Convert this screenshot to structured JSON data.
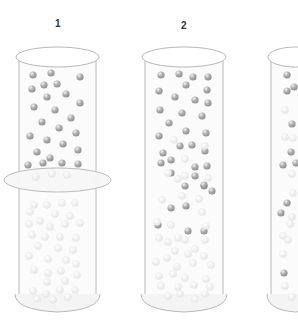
{
  "diagram": {
    "labels": [
      {
        "text": "1",
        "x": 55,
        "y": 18
      },
      {
        "text": "2",
        "x": 181,
        "y": 20
      }
    ],
    "colors": {
      "outline": "#b8b8b8",
      "glass_fill": "#fbfbfb",
      "ball_dark": "#8c8c8c",
      "ball_light": "#e4e4e4",
      "background": "#ffffff"
    },
    "cylinders": [
      {
        "id": 1,
        "left": 19,
        "right": 96,
        "top": 57,
        "bottom": 300,
        "has_divider_ring": true,
        "ring_y": 180,
        "dark_balls": [
          [
            33,
            75
          ],
          [
            51,
            73
          ],
          [
            80,
            77
          ],
          [
            32,
            89
          ],
          [
            44,
            85
          ],
          [
            57,
            84
          ],
          [
            66,
            94
          ],
          [
            47,
            97
          ],
          [
            80,
            103
          ],
          [
            34,
            107
          ],
          [
            55,
            110
          ],
          [
            71,
            118
          ],
          [
            42,
            122
          ],
          [
            59,
            128
          ],
          [
            76,
            133
          ],
          [
            30,
            136
          ],
          [
            47,
            140
          ],
          [
            63,
            144
          ],
          [
            78,
            150
          ],
          [
            37,
            152
          ],
          [
            50,
            158
          ],
          [
            62,
            163
          ],
          [
            28,
            165
          ],
          [
            43,
            163
          ],
          [
            78,
            164
          ]
        ],
        "light_balls": [
          [
            36,
            177
          ],
          [
            52,
            174
          ],
          [
            67,
            175
          ],
          [
            34,
            205
          ],
          [
            47,
            205
          ],
          [
            62,
            203
          ],
          [
            75,
            203
          ],
          [
            30,
            212
          ],
          [
            55,
            214
          ],
          [
            70,
            216
          ],
          [
            29,
            224
          ],
          [
            40,
            221
          ],
          [
            50,
            227
          ],
          [
            65,
            224
          ],
          [
            80,
            223
          ],
          [
            32,
            235
          ],
          [
            45,
            237
          ],
          [
            60,
            237
          ],
          [
            76,
            238
          ],
          [
            38,
            246
          ],
          [
            58,
            248
          ],
          [
            73,
            250
          ],
          [
            29,
            256
          ],
          [
            48,
            259
          ],
          [
            66,
            260
          ],
          [
            76,
            264
          ],
          [
            34,
            270
          ],
          [
            48,
            273
          ],
          [
            61,
            271
          ],
          [
            77,
            275
          ],
          [
            47,
            282
          ],
          [
            65,
            281
          ],
          [
            33,
            291
          ],
          [
            46,
            294
          ],
          [
            60,
            290
          ],
          [
            75,
            290
          ],
          [
            37,
            299
          ],
          [
            53,
            300
          ],
          [
            68,
            297
          ]
        ]
      },
      {
        "id": 2,
        "left": 145,
        "right": 223,
        "top": 57,
        "bottom": 300,
        "has_divider_ring": false,
        "dark_balls": [
          [
            161,
            75
          ],
          [
            179,
            74
          ],
          [
            193,
            77
          ],
          [
            208,
            77
          ],
          [
            186,
            85
          ],
          [
            159,
            91
          ],
          [
            207,
            90
          ],
          [
            175,
            97
          ],
          [
            195,
            100
          ],
          [
            208,
            103
          ],
          [
            160,
            110
          ],
          [
            182,
            113
          ],
          [
            202,
            116
          ],
          [
            169,
            123
          ],
          [
            186,
            131
          ],
          [
            159,
            136
          ],
          [
            206,
            133
          ],
          [
            180,
            146
          ],
          [
            163,
            153
          ],
          [
            192,
            145
          ],
          [
            205,
            151
          ],
          [
            161,
            163
          ],
          [
            171,
            160
          ],
          [
            207,
            166
          ],
          [
            195,
            176
          ],
          [
            171,
            173
          ],
          [
            195,
            167
          ],
          [
            171,
            208
          ],
          [
            212,
            191
          ],
          [
            158,
            225
          ],
          [
            186,
            206
          ],
          [
            188,
            231
          ],
          [
            204,
            231
          ],
          [
            204,
            186
          ],
          [
            185,
            186
          ],
          [
            204,
            185
          ]
        ],
        "light_balls": [
          [
            174,
            140
          ],
          [
            205,
            146
          ],
          [
            185,
            159
          ],
          [
            168,
            173
          ],
          [
            185,
            176
          ],
          [
            178,
            179
          ],
          [
            208,
            178
          ],
          [
            182,
            196
          ],
          [
            199,
            199
          ],
          [
            162,
            200
          ],
          [
            202,
            212
          ],
          [
            157,
            222
          ],
          [
            171,
            225
          ],
          [
            206,
            226
          ],
          [
            168,
            242
          ],
          [
            185,
            240
          ],
          [
            178,
            238
          ],
          [
            205,
            240
          ],
          [
            159,
            238
          ],
          [
            175,
            251
          ],
          [
            195,
            249
          ],
          [
            167,
            258
          ],
          [
            204,
            256
          ],
          [
            188,
            254
          ],
          [
            156,
            262
          ],
          [
            177,
            267
          ],
          [
            193,
            263
          ],
          [
            211,
            265
          ],
          [
            159,
            276
          ],
          [
            173,
            274
          ],
          [
            185,
            278
          ],
          [
            206,
            279
          ],
          [
            161,
            286
          ],
          [
            178,
            287
          ],
          [
            194,
            285
          ],
          [
            210,
            287
          ],
          [
            168,
            296
          ],
          [
            180,
            294
          ],
          [
            195,
            299
          ],
          [
            205,
            294
          ]
        ]
      },
      {
        "id": 3,
        "left": 271,
        "right": 320,
        "top": 57,
        "bottom": 300,
        "has_divider_ring": false,
        "dark_balls": [
          [
            287,
            75
          ],
          [
            287,
            91
          ],
          [
            294,
            87
          ],
          [
            292,
            124
          ],
          [
            291,
            152
          ],
          [
            283,
            165
          ],
          [
            296,
            163
          ],
          [
            287,
            203
          ],
          [
            281,
            213
          ],
          [
            284,
            273
          ]
        ],
        "light_balls": [
          [
            285,
            110
          ],
          [
            285,
            137
          ],
          [
            293,
            138
          ],
          [
            292,
            174
          ],
          [
            293,
            193
          ],
          [
            292,
            217
          ],
          [
            290,
            224
          ],
          [
            283,
            236
          ],
          [
            288,
            240
          ],
          [
            283,
            254
          ],
          [
            285,
            286
          ],
          [
            292,
            297
          ]
        ]
      }
    ]
  }
}
